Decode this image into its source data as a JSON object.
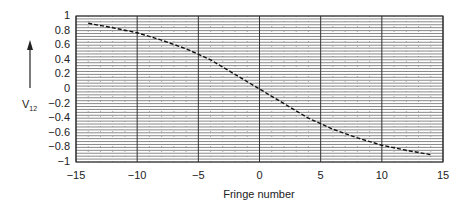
{
  "chart_data": {
    "type": "line",
    "title": "",
    "xlabel": "Fringe number",
    "ylabel": "V12",
    "ylabel_main": "V",
    "ylabel_sub": "12",
    "xlim": [
      -15,
      15
    ],
    "ylim": [
      -1,
      1
    ],
    "grid": true,
    "legend": null,
    "x_ticks": [
      "−15",
      "−10",
      "−5",
      "0",
      "5",
      "10",
      "15"
    ],
    "x_tick_values": [
      -15,
      -10,
      -5,
      0,
      5,
      10,
      15
    ],
    "y_ticks": [
      "1",
      "0.8",
      "0.6",
      "0.4",
      "0.2",
      "0",
      "−0.2",
      "−0.4",
      "−0.6",
      "−0.8",
      "−1"
    ],
    "y_tick_values": [
      1,
      0.8,
      0.6,
      0.4,
      0.2,
      0,
      -0.2,
      -0.4,
      -0.6,
      -0.8,
      -1
    ],
    "annotations": [
      "upward arrow beside V12 axis label"
    ],
    "series": [
      {
        "name": "V12",
        "style": "dashed",
        "x": [
          -14,
          -12,
          -10,
          -8,
          -6,
          -4,
          -2,
          0,
          2,
          4,
          6,
          8,
          10,
          12,
          14
        ],
        "y": [
          0.9,
          0.84,
          0.77,
          0.67,
          0.55,
          0.4,
          0.2,
          0.0,
          -0.2,
          -0.4,
          -0.55,
          -0.67,
          -0.77,
          -0.84,
          -0.9
        ]
      }
    ]
  }
}
